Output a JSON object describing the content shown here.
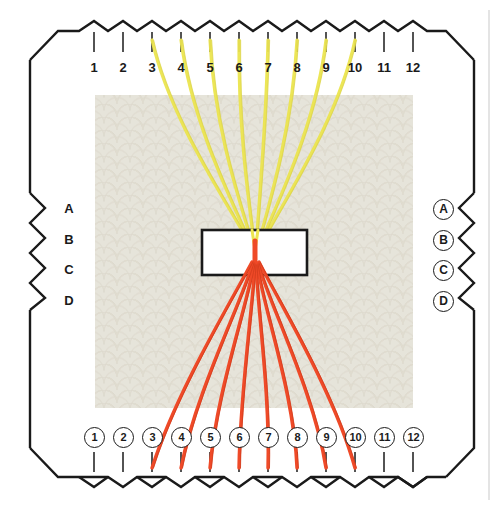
{
  "diagram": {
    "frame": {
      "name": "scalloped-pin-frame",
      "outline_color": "#1a1a1a",
      "left_edge_x": 30,
      "right_edge_x": 474,
      "top_edge_y": 22,
      "bottom_edge_y": 486
    },
    "fabric": {
      "name": "patterned-fabric-ground",
      "color": "#e4e1d6",
      "pattern": "seigaiha-fan-scallop",
      "x": 95,
      "y": 95,
      "width": 318,
      "height": 313
    },
    "motif_rect": {
      "name": "motif-outline-rectangle",
      "x": 202,
      "y": 230,
      "width": 105,
      "height": 45,
      "fill": "#ffffff",
      "stroke": "#1a1a1a"
    },
    "convergence_point": {
      "x": 255,
      "y": 252
    },
    "colors": {
      "thread_upper": "#ece54f",
      "thread_upper_edge": "#d8d04a",
      "thread_lower": "#ef4a28",
      "thread_lower_edge": "#d93f20",
      "ink": "#1a1a1a",
      "fabric": "#e4e1d6",
      "page": "#ffffff"
    },
    "top_scale": {
      "name": "top-pin-scale",
      "labels": [
        "1",
        "2",
        "3",
        "4",
        "5",
        "6",
        "7",
        "8",
        "9",
        "10",
        "11",
        "12"
      ],
      "tick_x": [
        94,
        123,
        152,
        181,
        210,
        239,
        268,
        297,
        326,
        355,
        384,
        413
      ],
      "label_y": 60,
      "tick_top_y": 44,
      "tick_bottom_y": 56
    },
    "bottom_scale": {
      "name": "bottom-pin-scale",
      "labels": [
        "1",
        "2",
        "3",
        "4",
        "5",
        "6",
        "7",
        "8",
        "9",
        "10",
        "11",
        "12"
      ],
      "circled": true,
      "tick_x": [
        94,
        123,
        152,
        181,
        210,
        239,
        268,
        297,
        326,
        355,
        384,
        413
      ],
      "label_y": 427,
      "tick_top_y": 452,
      "tick_bottom_y": 466
    },
    "left_scale": {
      "name": "left-row-scale",
      "labels": [
        "A",
        "B",
        "C",
        "D"
      ],
      "label_y": [
        202,
        233,
        263,
        294
      ],
      "label_x": 60,
      "circled": false
    },
    "right_scale": {
      "name": "right-row-scale",
      "labels": [
        "A",
        "B",
        "C",
        "D"
      ],
      "label_y": [
        202,
        233,
        263,
        294
      ],
      "label_x": 436,
      "circled": true
    },
    "upper_threads": {
      "name": "upper-yellow-threads",
      "color": "#ece54f",
      "connects_to_pins": [
        3,
        4,
        5,
        6,
        7,
        8,
        9,
        10
      ],
      "endpoints_x": [
        152,
        181,
        210,
        239,
        268,
        297,
        326,
        355
      ],
      "endpoint_y": 40,
      "stroke_width": 3.2
    },
    "lower_threads": {
      "name": "lower-red-threads",
      "color": "#ef4a28",
      "connects_to_pins": [
        3,
        4,
        5,
        6,
        7,
        8,
        9,
        10
      ],
      "endpoints_x": [
        152,
        181,
        210,
        239,
        268,
        297,
        326,
        355
      ],
      "endpoint_y": 468,
      "stroke_width": 3.4
    },
    "edge_rule": {
      "name": "page-edge-rule",
      "x": 489,
      "color": "#cfcfcf"
    }
  }
}
